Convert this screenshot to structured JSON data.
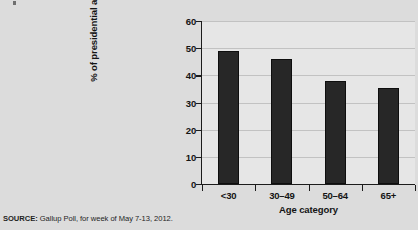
{
  "source_note": {
    "label": "SOURCE:",
    "text": " Gallup Poll, for week of May 7-13, 2012."
  },
  "colors": {
    "bar": "#272727",
    "page_background": "#dcdcdc",
    "plot_background": "#e6e6e6",
    "gridline": "#c2c2c2",
    "axis": "#1c1c1c",
    "text": "#141414"
  },
  "chart_data": {
    "type": "bar",
    "title": "",
    "subtitle": "",
    "xlabel": "Age category",
    "ylabel": "% of presidential approval",
    "categories": [
      "<30",
      "30–49",
      "50–64",
      "65+"
    ],
    "values": [
      49,
      46,
      38,
      35.5
    ],
    "series": [
      {
        "name": "% of presidential approval",
        "values": [
          49,
          46,
          38,
          35.5
        ]
      }
    ],
    "ylim": [
      0,
      60
    ],
    "yticks": [
      0,
      10,
      20,
      30,
      40,
      50,
      60
    ],
    "ytick_labels": [
      "0",
      "10",
      "20",
      "30",
      "40",
      "50",
      "60"
    ],
    "grid": true,
    "grid_axis": "y",
    "legend": false,
    "legend_position": "none",
    "annotations": []
  }
}
